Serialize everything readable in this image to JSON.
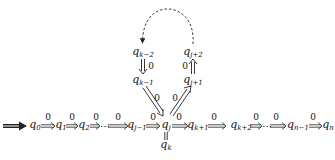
{
  "diagram": {
    "type": "state-transition-chain",
    "start_arrow": "start-arrow",
    "main_row": [
      {
        "id": "q0",
        "base": "q",
        "sub": "0"
      },
      {
        "id": "q1",
        "base": "q",
        "sub": "1"
      },
      {
        "id": "q2",
        "base": "q",
        "sub": "2"
      },
      {
        "id": "qj-1",
        "base": "q",
        "sub": "j−1"
      },
      {
        "id": "qj",
        "base": "q",
        "sub": "j"
      },
      {
        "id": "qk+1",
        "base": "q",
        "sub": "k+1"
      },
      {
        "id": "qk+2",
        "base": "q",
        "sub": "k+2"
      },
      {
        "id": "qn-1",
        "base": "q",
        "sub": "n−1"
      },
      {
        "id": "qn",
        "base": "q",
        "sub": "n"
      }
    ],
    "upper_nodes": [
      {
        "id": "qk-2",
        "base": "q",
        "sub": "k−2"
      },
      {
        "id": "qk-1",
        "base": "q",
        "sub": "k−1"
      },
      {
        "id": "qj+1",
        "base": "q",
        "sub": "j+1"
      },
      {
        "id": "qj+2",
        "base": "q",
        "sub": "j+2"
      }
    ],
    "lower_node": {
      "id": "qk",
      "base": "q",
      "sub": "k"
    },
    "ellipsis": "⋯",
    "edge_label": "0",
    "edges": [
      {
        "from": "q0",
        "to": "q1",
        "label": "0"
      },
      {
        "from": "q1",
        "to": "q2",
        "label": "0"
      },
      {
        "from": "q2",
        "to": "…",
        "label": "0"
      },
      {
        "from": "…",
        "to": "qj-1",
        "label": "0"
      },
      {
        "from": "qj-1",
        "to": "qj",
        "label": "0"
      },
      {
        "from": "qj",
        "to": "qk+1",
        "label": "0"
      },
      {
        "from": "qk+1",
        "to": "qk+2",
        "label": "0"
      },
      {
        "from": "qk+2",
        "to": "…",
        "label": "0"
      },
      {
        "from": "…",
        "to": "qn-1",
        "label": "0"
      },
      {
        "from": "qn-1",
        "to": "qn",
        "label": "0"
      },
      {
        "from": "qk-2",
        "to": "qk-1",
        "label": "0"
      },
      {
        "from": "qk-1",
        "to": "qj",
        "label": "0"
      },
      {
        "from": "qj",
        "to": "qj+1",
        "label": "0"
      },
      {
        "from": "qj+1",
        "to": "qj+2",
        "label": "0"
      },
      {
        "from": "qj+2",
        "to": "qk-2",
        "label": "",
        "style": "dashed"
      },
      {
        "from": "qj",
        "to": "qk",
        "label": "",
        "style": "equality"
      }
    ]
  }
}
